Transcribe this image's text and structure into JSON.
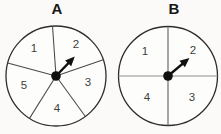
{
  "canvas": {
    "width": 221,
    "height": 134,
    "background": "#fbfaf8"
  },
  "colors": {
    "face": "#fdfdfb",
    "circle_stroke": "#2e2e2e",
    "divider": "#4a4a4a",
    "number": "#3d3d3d",
    "arrow": "#101010"
  },
  "spinners": [
    {
      "label": "A",
      "section_count": 5,
      "section_values": [
        "1",
        "2",
        "3",
        "4",
        "5"
      ],
      "arrow_points_to": "2",
      "cx": 56,
      "cy": 76,
      "r": 50,
      "dot_r": 4.8,
      "dividers": [
        {
          "angle": 19
        },
        {
          "angle": 94
        },
        {
          "angle": 165
        },
        {
          "angle": 238
        },
        {
          "angle": 306
        }
      ],
      "labels": [
        {
          "text": "1",
          "x": 34,
          "y": 48
        },
        {
          "text": "2",
          "x": 76,
          "y": 44
        },
        {
          "text": "5",
          "x": 24,
          "y": 85
        },
        {
          "text": "3",
          "x": 88,
          "y": 82
        },
        {
          "text": "4",
          "x": 57,
          "y": 108
        }
      ],
      "arrow": {
        "angle": 46,
        "length": 27
      }
    },
    {
      "label": "B",
      "section_count": 4,
      "section_values": [
        "1",
        "2",
        "3",
        "4"
      ],
      "arrow_points_to": "2",
      "cx": 168,
      "cy": 76,
      "r": 49.5,
      "dot_r": 4.8,
      "dividers": [
        {
          "angle": 0,
          "color": "#8f8f8f"
        },
        {
          "angle": 180,
          "color": "#8f8f8f"
        },
        {
          "angle": 90,
          "color": "#565656"
        },
        {
          "angle": 270,
          "color": "#565656"
        }
      ],
      "labels": [
        {
          "text": "1",
          "x": 145,
          "y": 51
        },
        {
          "text": "2",
          "x": 193,
          "y": 50
        },
        {
          "text": "4",
          "x": 147,
          "y": 97
        },
        {
          "text": "3",
          "x": 192,
          "y": 97
        }
      ],
      "arrow": {
        "angle": 40,
        "length": 28
      }
    }
  ]
}
